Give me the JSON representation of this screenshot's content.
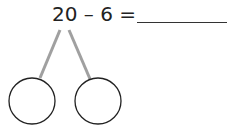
{
  "problem": {
    "equation": "20 – 6 =",
    "answer_blank": ""
  },
  "number_bond": {
    "left_circle": "",
    "right_circle": "",
    "connector_color": "#a0a0a0",
    "circle_stroke": "#222222"
  }
}
